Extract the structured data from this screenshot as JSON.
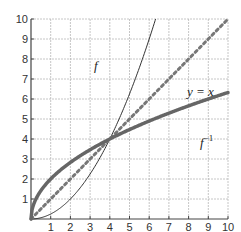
{
  "chart_data": {
    "type": "line",
    "title": "",
    "xlabel": "",
    "ylabel": "",
    "xlim": [
      0,
      10
    ],
    "ylim": [
      0,
      10
    ],
    "grid": true,
    "x_ticks": [
      1,
      2,
      3,
      4,
      5,
      6,
      7,
      8,
      9,
      10
    ],
    "y_ticks": [
      1,
      2,
      3,
      4,
      5,
      6,
      7,
      8,
      9,
      10
    ],
    "series": [
      {
        "name": "f",
        "label": "f",
        "formula": "x^2/4",
        "style": "thin solid",
        "x": [
          0,
          1,
          2,
          3,
          4,
          5,
          6,
          6.32
        ],
        "values": [
          0,
          0.25,
          1,
          2.25,
          4,
          6.25,
          9,
          10
        ]
      },
      {
        "name": "y = x",
        "label": "y = x",
        "formula": "x",
        "style": "dotted",
        "x": [
          0,
          1,
          2,
          3,
          4,
          5,
          6,
          7,
          8,
          9,
          10
        ],
        "values": [
          0,
          1,
          2,
          3,
          4,
          5,
          6,
          7,
          8,
          9,
          10
        ]
      },
      {
        "name": "f^-1",
        "label": "f⁻¹",
        "formula": "2*sqrt(x)",
        "style": "thick solid",
        "x": [
          0,
          1,
          2,
          3,
          4,
          5,
          6,
          7,
          8,
          9,
          10
        ],
        "values": [
          0,
          2,
          2.83,
          3.46,
          4,
          4.47,
          4.9,
          5.29,
          5.66,
          6,
          6.32
        ]
      }
    ],
    "annotations": [
      {
        "text": "f",
        "x": 3.2,
        "y": 7.6
      },
      {
        "text": "y = x",
        "x": 8.0,
        "y": 6.3
      },
      {
        "text": "f⁻¹",
        "x": 8.0,
        "y": 3.8
      }
    ],
    "intersection": {
      "x": 4,
      "y": 4
    }
  },
  "labels": {
    "f": "f",
    "identity": "y = x",
    "inverse": "f",
    "inverse_sup": "−1"
  }
}
